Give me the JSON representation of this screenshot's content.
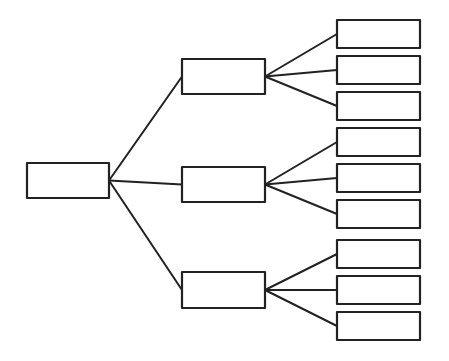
{
  "diagram": {
    "type": "tree",
    "style": "hand-drawn",
    "stroke_color": "#222222",
    "background": "#ffffff",
    "root": {
      "id": "root",
      "label": "",
      "x": 27,
      "y": 163,
      "w": 82,
      "h": 35
    },
    "children": [
      {
        "id": "mid-1",
        "label": "",
        "x": 182,
        "y": 59,
        "w": 83,
        "h": 35,
        "leaves": [
          {
            "id": "leaf-1",
            "label": "",
            "x": 337,
            "y": 20,
            "w": 83,
            "h": 28
          },
          {
            "id": "leaf-2",
            "label": "",
            "x": 337,
            "y": 56,
            "w": 83,
            "h": 28
          },
          {
            "id": "leaf-3",
            "label": "",
            "x": 337,
            "y": 92,
            "w": 83,
            "h": 28
          }
        ]
      },
      {
        "id": "mid-2",
        "label": "",
        "x": 182,
        "y": 167,
        "w": 83,
        "h": 35,
        "leaves": [
          {
            "id": "leaf-4",
            "label": "",
            "x": 337,
            "y": 128,
            "w": 83,
            "h": 28
          },
          {
            "id": "leaf-5",
            "label": "",
            "x": 337,
            "y": 164,
            "w": 83,
            "h": 28
          },
          {
            "id": "leaf-6",
            "label": "",
            "x": 337,
            "y": 200,
            "w": 83,
            "h": 28
          }
        ]
      },
      {
        "id": "mid-3",
        "label": "",
        "x": 182,
        "y": 272,
        "w": 83,
        "h": 36,
        "leaves": [
          {
            "id": "leaf-7",
            "label": "",
            "x": 337,
            "y": 240,
            "w": 83,
            "h": 28
          },
          {
            "id": "leaf-8",
            "label": "",
            "x": 337,
            "y": 276,
            "w": 83,
            "h": 28
          },
          {
            "id": "leaf-9",
            "label": "",
            "x": 337,
            "y": 312,
            "w": 83,
            "h": 28
          }
        ]
      }
    ]
  }
}
